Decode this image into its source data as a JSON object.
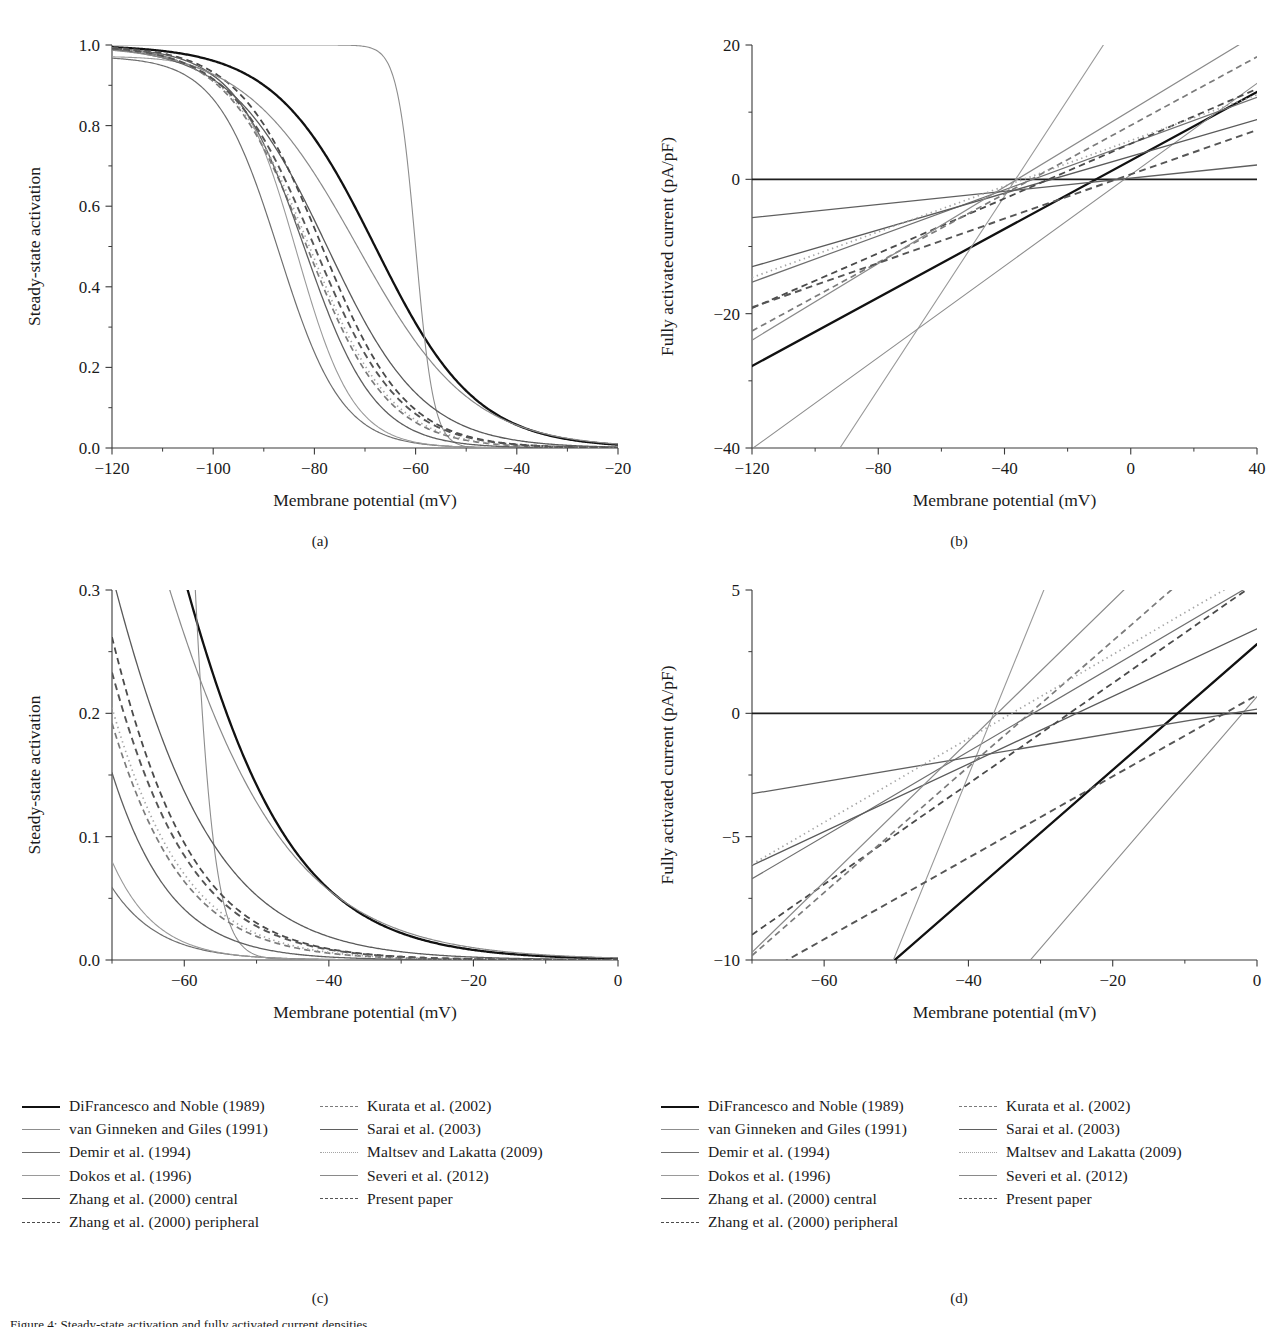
{
  "figure": {
    "caption_visible_fragment": "Figure 4: Steady-state activation and fully activated current densities",
    "subcaptions": {
      "a": "(a)",
      "b": "(b)",
      "c": "(c)",
      "d": "(d)"
    }
  },
  "axis_titles": {
    "x_membrane": "Membrane potential (mV)",
    "y_activation": "Steady-state activation",
    "y_current": "Fully activated current (pA/pF)"
  },
  "legend": {
    "entries": [
      {
        "label": "DiFrancesco and Noble (1989)",
        "style": "solid",
        "color": "#111111",
        "width": 2.3,
        "column": 1
      },
      {
        "label": "van Ginneken and Giles (1991)",
        "style": "solid",
        "color": "#8d8d8d",
        "width": 1.1,
        "column": 1
      },
      {
        "label": "Demir et al. (1994)",
        "style": "solid",
        "color": "#6f6f6f",
        "width": 1.2,
        "column": 1
      },
      {
        "label": "Dokos et al. (1996)",
        "style": "solid",
        "color": "#9a9a9a",
        "width": 1.1,
        "column": 1
      },
      {
        "label": "Zhang et al. (2000) central",
        "style": "solid",
        "color": "#5a5a5a",
        "width": 1.3,
        "column": 1
      },
      {
        "label": "Zhang et al. (2000) peripheral",
        "style": "dashed",
        "color": "#4a4a4a",
        "width": 1.8,
        "column": 1
      },
      {
        "label": "Kurata et al. (2002)",
        "style": "dashed",
        "color": "#7b7b7b",
        "width": 1.7,
        "column": 2
      },
      {
        "label": "Sarai et al. (2003)",
        "style": "solid",
        "color": "#5f5f5f",
        "width": 1.3,
        "column": 2
      },
      {
        "label": "Maltsev and Lakatta (2009)",
        "style": "dotted",
        "color": "#a5a5a5",
        "width": 1.7,
        "column": 2
      },
      {
        "label": "Severi et al. (2012)",
        "style": "solid",
        "color": "#8a8a8a",
        "width": 1.2,
        "column": 2
      },
      {
        "label": "Present paper",
        "style": "dashed",
        "color": "#555555",
        "width": 1.9,
        "column": 2
      }
    ]
  },
  "chart_data": [
    {
      "panel": "a",
      "type": "line",
      "title": "",
      "xlabel": "Membrane potential (mV)",
      "ylabel": "Steady-state activation",
      "xlim": [
        -120,
        -20
      ],
      "ylim": [
        0.0,
        1.0
      ],
      "xticks": [
        -120,
        -100,
        -80,
        -60,
        -40,
        -20
      ],
      "xticklabels": [
        "−120",
        "−100",
        "−80",
        "−60",
        "−40",
        "−20"
      ],
      "yticks": [
        0.0,
        0.2,
        0.4,
        0.6,
        0.8,
        1.0
      ],
      "yticklabels": [
        "0.0",
        "0.2",
        "0.4",
        "0.6",
        "0.8",
        "1.0"
      ],
      "minor_xticks": [
        -110,
        -90,
        -70,
        -50,
        -30
      ],
      "minor_yticks": [
        0.1,
        0.3,
        0.5,
        0.7,
        0.9
      ],
      "grid": false,
      "legend_position": "external-below",
      "model": "boltzmann_inactivating",
      "series": [
        {
          "name": "DiFrancesco and Noble (1989)",
          "v_half": -68.0,
          "slope": 10.0,
          "ymax": 1.0
        },
        {
          "name": "van Ginneken and Giles (1991)",
          "v_half": -60.0,
          "slope": 1.8,
          "ymax": 1.0
        },
        {
          "name": "Demir et al. (1994)",
          "v_half": -87.0,
          "slope": 6.2,
          "ymax": 0.972
        },
        {
          "name": "Dokos et al. (1996)",
          "v_half": -83.5,
          "slope": 5.6,
          "ymax": 0.972
        },
        {
          "name": "Zhang et al. (2000) central",
          "v_half": -77.5,
          "slope": 9.5,
          "ymax": 1.0
        },
        {
          "name": "Zhang et al. (2000) peripheral",
          "v_half": -78.5,
          "slope": 8.2,
          "ymax": 1.0
        },
        {
          "name": "Kurata et al. (2002)",
          "v_half": -81.5,
          "slope": 8.0,
          "ymax": 1.0
        },
        {
          "name": "Sarai et al. (2003)",
          "v_half": -82.0,
          "slope": 7.0,
          "ymax": 0.995
        },
        {
          "name": "Maltsev and Lakatta (2009)",
          "v_half": -81.0,
          "slope": 8.1,
          "ymax": 1.0
        },
        {
          "name": "Severi et al. (2012)",
          "v_half": -71.5,
          "slope": 11.2,
          "ymax": 1.0
        },
        {
          "name": "Present paper",
          "v_half": -80.0,
          "slope": 8.4,
          "ymax": 1.0
        }
      ]
    },
    {
      "panel": "b",
      "type": "line",
      "title": "",
      "xlabel": "Membrane potential (mV)",
      "ylabel": "Fully activated current (pA/pF)",
      "xlim": [
        -120,
        40
      ],
      "ylim": [
        -40,
        20
      ],
      "xticks": [
        -120,
        -80,
        -40,
        0,
        40
      ],
      "xticklabels": [
        "−120",
        "−80",
        "−40",
        "0",
        "40"
      ],
      "yticks": [
        -40,
        -20,
        0,
        20
      ],
      "yticklabels": [
        "−40",
        "−20",
        "0",
        "20"
      ],
      "minor_xticks": [
        -100,
        -60,
        -20,
        20
      ],
      "minor_yticks": [
        -30,
        -10,
        10
      ],
      "grid": false,
      "legend_position": "external-below",
      "model": "linear_iv",
      "zero_line": true,
      "series": [
        {
          "name": "DiFrancesco and Noble (1989)",
          "reversal": -11.0,
          "slope": 0.255
        },
        {
          "name": "van Ginneken and Giles (1991)",
          "reversal": -2.0,
          "slope": 0.34
        },
        {
          "name": "Demir et al. (1994)",
          "reversal": -31.0,
          "slope": 0.172
        },
        {
          "name": "Dokos et al. (1996)",
          "reversal": -36.5,
          "slope": 0.719
        },
        {
          "name": "Zhang et al. (2000) central",
          "reversal": -25.0,
          "slope": 0.137
        },
        {
          "name": "Zhang et al. (2000) peripheral",
          "reversal": -26.0,
          "slope": 0.204
        },
        {
          "name": "Kurata et al. (2002)",
          "reversal": -31.5,
          "slope": 0.255
        },
        {
          "name": "Sarai et al. (2003)",
          "reversal": -3.5,
          "slope": 0.049
        },
        {
          "name": "Maltsev and Lakatta (2009)",
          "reversal": -34.0,
          "slope": 0.17
        },
        {
          "name": "Severi et al. (2012)",
          "reversal": -36.0,
          "slope": 0.285
        },
        {
          "name": "Present paper",
          "reversal": -4.5,
          "slope": 0.165
        }
      ]
    },
    {
      "panel": "c",
      "type": "line",
      "title": "",
      "xlabel": "Membrane potential (mV)",
      "ylabel": "Steady-state activation",
      "xlim": [
        -70,
        0
      ],
      "ylim": [
        0.0,
        0.3
      ],
      "xticks": [
        -60,
        -40,
        -20,
        0
      ],
      "xticklabels": [
        "−60",
        "−40",
        "−20",
        "0"
      ],
      "yticks": [
        0.0,
        0.1,
        0.2,
        0.3
      ],
      "yticklabels": [
        "0.0",
        "0.1",
        "0.2",
        "0.3"
      ],
      "minor_xticks": [
        -70,
        -50,
        -30,
        -10
      ],
      "minor_yticks": [
        0.05,
        0.15,
        0.25
      ],
      "grid": false,
      "legend_position": "external-below",
      "note": "magnified low-activation region of panel (a)",
      "model": "boltzmann_inactivating",
      "series": [
        {
          "name": "DiFrancesco and Noble (1989)",
          "v_half": -68.0,
          "slope": 10.0,
          "ymax": 1.0
        },
        {
          "name": "van Ginneken and Giles (1991)",
          "v_half": -60.0,
          "slope": 1.8,
          "ymax": 1.0
        },
        {
          "name": "Demir et al. (1994)",
          "v_half": -87.0,
          "slope": 6.2,
          "ymax": 0.972
        },
        {
          "name": "Dokos et al. (1996)",
          "v_half": -83.5,
          "slope": 5.6,
          "ymax": 0.972
        },
        {
          "name": "Zhang et al. (2000) central",
          "v_half": -77.5,
          "slope": 9.5,
          "ymax": 1.0
        },
        {
          "name": "Zhang et al. (2000) peripheral",
          "v_half": -78.5,
          "slope": 8.2,
          "ymax": 1.0
        },
        {
          "name": "Kurata et al. (2002)",
          "v_half": -81.5,
          "slope": 8.0,
          "ymax": 1.0
        },
        {
          "name": "Sarai et al. (2003)",
          "v_half": -82.0,
          "slope": 7.0,
          "ymax": 0.995
        },
        {
          "name": "Maltsev and Lakatta (2009)",
          "v_half": -81.0,
          "slope": 8.1,
          "ymax": 1.0
        },
        {
          "name": "Severi et al. (2012)",
          "v_half": -71.5,
          "slope": 11.2,
          "ymax": 1.0
        },
        {
          "name": "Present paper",
          "v_half": -80.0,
          "slope": 8.4,
          "ymax": 1.0
        }
      ]
    },
    {
      "panel": "d",
      "type": "line",
      "title": "",
      "xlabel": "Membrane potential (mV)",
      "ylabel": "Fully activated current (pA/pF)",
      "xlim": [
        -70,
        0
      ],
      "ylim": [
        -10,
        5
      ],
      "xticks": [
        -60,
        -40,
        -20,
        0
      ],
      "xticklabels": [
        "−60",
        "−40",
        "−20",
        "0"
      ],
      "yticks": [
        -10,
        -5,
        0,
        5
      ],
      "yticklabels": [
        "−10",
        "−5",
        "0",
        "5"
      ],
      "minor_xticks": [
        -70,
        -50,
        -30,
        -10
      ],
      "minor_yticks": [
        -7.5,
        -2.5,
        2.5
      ],
      "grid": false,
      "legend_position": "external-below",
      "note": "magnified physiological range of panel (b)",
      "model": "linear_iv",
      "zero_line": true,
      "series": [
        {
          "name": "DiFrancesco and Noble (1989)",
          "reversal": -11.0,
          "slope": 0.255
        },
        {
          "name": "van Ginneken and Giles (1991)",
          "reversal": -2.0,
          "slope": 0.34
        },
        {
          "name": "Demir et al. (1994)",
          "reversal": -31.0,
          "slope": 0.172
        },
        {
          "name": "Dokos et al. (1996)",
          "reversal": -36.5,
          "slope": 0.719
        },
        {
          "name": "Zhang et al. (2000) central",
          "reversal": -25.0,
          "slope": 0.137
        },
        {
          "name": "Zhang et al. (2000) peripheral",
          "reversal": -26.0,
          "slope": 0.204
        },
        {
          "name": "Kurata et al. (2002)",
          "reversal": -31.5,
          "slope": 0.255
        },
        {
          "name": "Sarai et al. (2003)",
          "reversal": -3.5,
          "slope": 0.049
        },
        {
          "name": "Maltsev and Lakatta (2009)",
          "reversal": -34.0,
          "slope": 0.17
        },
        {
          "name": "Severi et al. (2012)",
          "reversal": -36.0,
          "slope": 0.285
        },
        {
          "name": "Present paper",
          "reversal": -4.5,
          "slope": 0.165
        }
      ]
    }
  ]
}
